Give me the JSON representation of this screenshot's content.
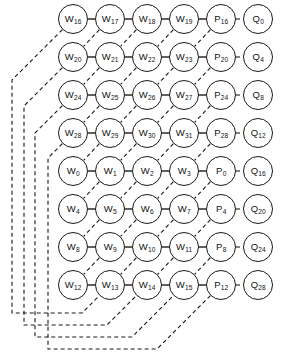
{
  "diagram": {
    "type": "node-grid-dataflow",
    "node_radius": 15,
    "grid": {
      "origin_x": 73,
      "origin_y": 19,
      "col_step": 37,
      "row_step": 38,
      "rows": 8,
      "cols": 6
    },
    "rows": [
      {
        "index": 0,
        "nodes": [
          {
            "base": "W",
            "sub": "16"
          },
          {
            "base": "W",
            "sub": "17"
          },
          {
            "base": "W",
            "sub": "18"
          },
          {
            "base": "W",
            "sub": "19"
          },
          {
            "base": "P",
            "sub": "16"
          },
          {
            "base": "Q",
            "sub": "0"
          }
        ]
      },
      {
        "index": 1,
        "nodes": [
          {
            "base": "W",
            "sub": "20"
          },
          {
            "base": "W",
            "sub": "21"
          },
          {
            "base": "W",
            "sub": "22"
          },
          {
            "base": "W",
            "sub": "23"
          },
          {
            "base": "P",
            "sub": "20"
          },
          {
            "base": "Q",
            "sub": "4"
          }
        ]
      },
      {
        "index": 2,
        "nodes": [
          {
            "base": "W",
            "sub": "24"
          },
          {
            "base": "W",
            "sub": "25"
          },
          {
            "base": "W",
            "sub": "26"
          },
          {
            "base": "W",
            "sub": "27"
          },
          {
            "base": "P",
            "sub": "24"
          },
          {
            "base": "Q",
            "sub": "8"
          }
        ]
      },
      {
        "index": 3,
        "nodes": [
          {
            "base": "W",
            "sub": "28"
          },
          {
            "base": "W",
            "sub": "29"
          },
          {
            "base": "W",
            "sub": "30"
          },
          {
            "base": "W",
            "sub": "31"
          },
          {
            "base": "P",
            "sub": "28"
          },
          {
            "base": "Q",
            "sub": "12"
          }
        ]
      },
      {
        "index": 4,
        "nodes": [
          {
            "base": "W",
            "sub": "0"
          },
          {
            "base": "W",
            "sub": "1"
          },
          {
            "base": "W",
            "sub": "2"
          },
          {
            "base": "W",
            "sub": "3"
          },
          {
            "base": "P",
            "sub": "0"
          },
          {
            "base": "Q",
            "sub": "16"
          }
        ]
      },
      {
        "index": 5,
        "nodes": [
          {
            "base": "W",
            "sub": "4"
          },
          {
            "base": "W",
            "sub": "5"
          },
          {
            "base": "W",
            "sub": "6"
          },
          {
            "base": "W",
            "sub": "7"
          },
          {
            "base": "P",
            "sub": "4"
          },
          {
            "base": "Q",
            "sub": "20"
          }
        ]
      },
      {
        "index": 6,
        "nodes": [
          {
            "base": "W",
            "sub": "8"
          },
          {
            "base": "W",
            "sub": "9"
          },
          {
            "base": "W",
            "sub": "10"
          },
          {
            "base": "W",
            "sub": "11"
          },
          {
            "base": "P",
            "sub": "8"
          },
          {
            "base": "Q",
            "sub": "24"
          }
        ]
      },
      {
        "index": 7,
        "nodes": [
          {
            "base": "W",
            "sub": "12"
          },
          {
            "base": "W",
            "sub": "13"
          },
          {
            "base": "W",
            "sub": "14"
          },
          {
            "base": "W",
            "sub": "15"
          },
          {
            "base": "P",
            "sub": "12"
          },
          {
            "base": "Q",
            "sub": "28"
          }
        ]
      }
    ],
    "edges": {
      "solid_horizontal": "W-to-W and W-to-P links within each row",
      "dashed_short_horizontal": "P-to-Q link at end of each row",
      "dashed_diagonal": "node to lower-left neighbour in next row",
      "dashed_feedback": "left-column wrap-around channels routed down the left margin and across the bottom"
    },
    "feedback_channels": [
      {
        "source": "W16",
        "channel_x": 12,
        "turn_y": 313,
        "target": "W13"
      },
      {
        "source": "W20",
        "channel_x": 24,
        "turn_y": 325,
        "target": "W14"
      },
      {
        "source": "W24",
        "channel_x": 35,
        "turn_y": 337,
        "target": "W15"
      },
      {
        "source": "W28",
        "channel_x": 48,
        "turn_y": 349,
        "target": "P12"
      }
    ],
    "colors": {
      "stroke": "#1a1a1a",
      "node_fill": "#ffffff",
      "background": "#ffffff"
    }
  }
}
